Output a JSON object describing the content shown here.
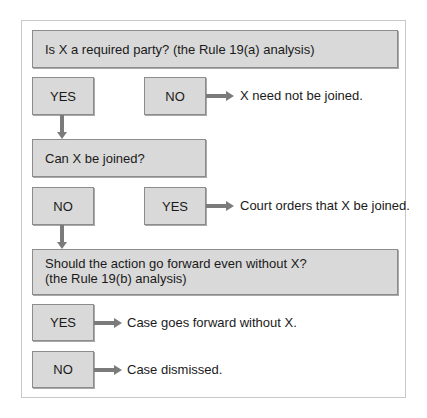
{
  "diagram": {
    "q1": {
      "text": "Is X a required party? (the Rule 19(a) analysis)"
    },
    "q1_yes": "YES",
    "q1_no": "NO",
    "q1_no_outcome": "X need not be joined.",
    "q2": {
      "text": "Can X be joined?"
    },
    "q2_no": "NO",
    "q2_yes": "YES",
    "q2_yes_outcome": "Court orders that X be joined.",
    "q3": {
      "line1": "Should the action go forward even without X?",
      "line2": "(the Rule 19(b) analysis)"
    },
    "q3_yes": "YES",
    "q3_yes_outcome": "Case goes forward without X.",
    "q3_no": "NO",
    "q3_no_outcome": "Case dismissed."
  },
  "colors": {
    "box_fill": "#d9d9d9",
    "box_border": "#8c8c8c",
    "arrow": "#7b7b7b",
    "frame_border": "#c9c9c9"
  }
}
